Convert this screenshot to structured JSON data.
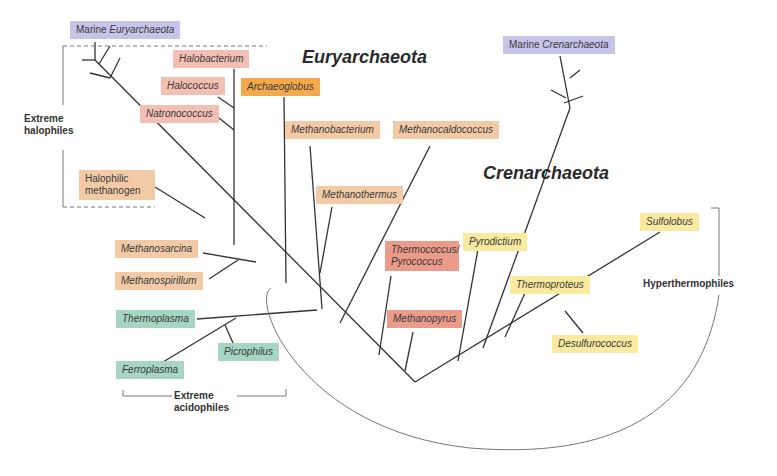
{
  "titles": {
    "euryarchaeota": "Euryarchaeota",
    "crenarchaeota": "Crenarchaeota"
  },
  "groups": {
    "extreme_halophiles": "Extreme halophiles",
    "extreme_acidophiles": "Extreme acidophiles",
    "hyperthermophiles": "Hyperthermophiles"
  },
  "taxa": {
    "marine_eury_prefix": "Marine ",
    "marine_eury_italic": "Euryarchaeota",
    "marine_cren_prefix": "Marine ",
    "marine_cren_italic": "Crenarchaeota",
    "halobacterium": "Halobacterium",
    "halococcus": "Halococcus",
    "natronococcus": "Natronococcus",
    "archaeoglobus": "Archaeoglobus",
    "halophilic_methanogen": "Halophilic methanogen",
    "methanobacterium": "Methanobacterium",
    "methanocaldococcus": "Methanocaldococcus",
    "methanothermus": "Methanothermus",
    "methanosarcina": "Methanosarcina",
    "methanospirillum": "Methanospirillum",
    "thermococcus_pyrococcus": "Thermococcus/ Pyrococcus",
    "methanopyrus": "Methanopyrus",
    "pyrodictium": "Pyrodictium",
    "thermoproteus": "Thermoproteus",
    "sulfolobus": "Sulfolobus",
    "desulfurococcus": "Desulfurococcus",
    "thermoplasma": "Thermoplasma",
    "picrophilus": "Picrophilus",
    "ferroplasma": "Ferroplasma"
  },
  "colors": {
    "marine": "#c7c4ea",
    "halophile": "#f4bfb3",
    "archaeoglobus": "#f6a94a",
    "methanogen": "#f2caa6",
    "thermococcus": "#ec9a8a",
    "crenarchaeota_hyperthermophile": "#faeaa0",
    "acidophile": "#a6d5c3",
    "line": "#333333"
  }
}
